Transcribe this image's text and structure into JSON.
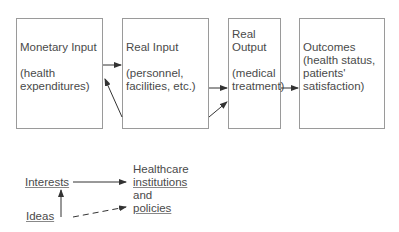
{
  "boxes": {
    "monetary_input": {
      "title": "Monetary Input",
      "detail_1": "(health",
      "detail_2": "expenditures)"
    },
    "real_input": {
      "title": "Real Input",
      "detail_1": "(personnel,",
      "detail_2": "facilities, etc.)"
    },
    "real_output": {
      "title_1": "Real",
      "title_2": "Output",
      "detail_1": "(medical",
      "detail_2": "treatment)"
    },
    "outcomes": {
      "title": "Outcomes",
      "detail_1": "(health status,",
      "detail_2": "patients'",
      "detail_3": "satisfaction)"
    }
  },
  "legend": {
    "interests": "Interests",
    "ideas": "Ideas",
    "target_1": "Healthcare",
    "target_2": "institutions",
    "target_3": "and",
    "target_4": "policies"
  },
  "colors": {
    "line": "#333333",
    "border": "#9a9a9a",
    "text": "#4a4a4a"
  }
}
